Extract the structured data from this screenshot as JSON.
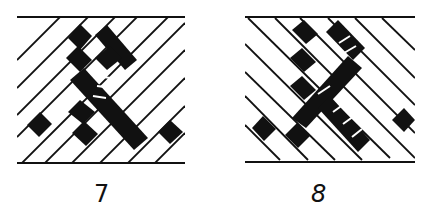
{
  "figures": [
    {
      "id": "7",
      "label": "7",
      "pattern": "diagonal-hatch-rising",
      "description": "Braid pattern with dark woven bands crossing ascending hatch lines"
    },
    {
      "id": "8",
      "label": "8",
      "pattern": "diagonal-hatch-falling",
      "description": "Braid pattern with dark woven bands crossing descending hatch lines"
    }
  ],
  "colors": {
    "ink": "#111111",
    "paper": "#ffffff"
  }
}
